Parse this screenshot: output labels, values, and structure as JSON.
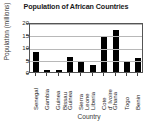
{
  "chart_data": {
    "type": "bar",
    "title": "Population of African Countries",
    "xlabel": "Country",
    "ylabel": "Population (millions)",
    "categories": [
      "Senegal",
      "Gambia",
      "Guinea Bissau",
      "Guinea",
      "Sierra Leone",
      "Liberia",
      "Cote d' Ivoire",
      "Ghana",
      "Togo",
      "Benin"
    ],
    "category_label_lines": [
      [
        "Senegal"
      ],
      [
        "Gambia"
      ],
      [
        "Guinea",
        "Bissau"
      ],
      [
        "Guinea"
      ],
      [
        "Sierra",
        "Leone"
      ],
      [
        "Liberia"
      ],
      [
        "Cote",
        "d' Ivoire"
      ],
      [
        "Ghana"
      ],
      [
        "Togo"
      ],
      [
        "Benin"
      ]
    ],
    "values": [
      8,
      1,
      1,
      6,
      4.5,
      3,
      14,
      17,
      4.5,
      5.5
    ],
    "ylim": [
      0,
      20
    ],
    "yticks": [
      0,
      5,
      10,
      15,
      20
    ],
    "ytick_labels": [
      "0",
      "5",
      "10",
      "15",
      "20"
    ],
    "grid": true,
    "grid_axis": "y",
    "legend": false,
    "bar_color": "#000000",
    "axis_color": "#555555",
    "grid_color": "#b8b8b8",
    "text_color": "#222222",
    "background": "#ffffff"
  }
}
